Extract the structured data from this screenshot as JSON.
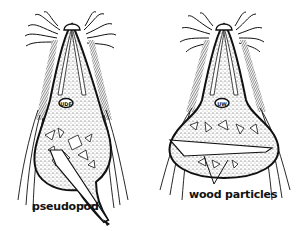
{
  "figure": {
    "organisms": [
      {
        "id": "left",
        "description": "flagellate engulfing wood with pseudopod"
      },
      {
        "id": "right",
        "description": "flagellate containing wood particles"
      }
    ],
    "labels": {
      "pseudopod": "pseudopod",
      "wood_particles": "wood particles"
    },
    "colors": {
      "ink": "#111111",
      "background": "#ffffff"
    }
  }
}
